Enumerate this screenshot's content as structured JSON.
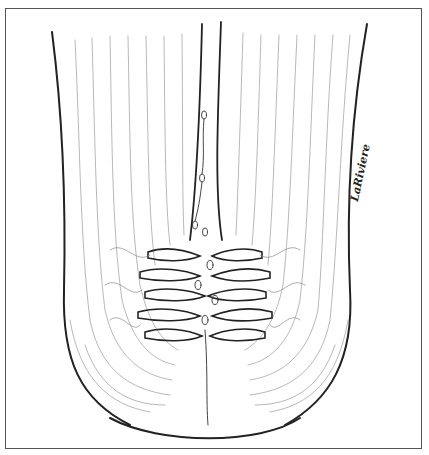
{
  "figure": {
    "type": "anatomical line drawing",
    "signature": "LaRiviere",
    "colors": {
      "line": "#222222",
      "fine_line": "#888888",
      "frame": "#555555",
      "background": "#ffffff"
    }
  }
}
